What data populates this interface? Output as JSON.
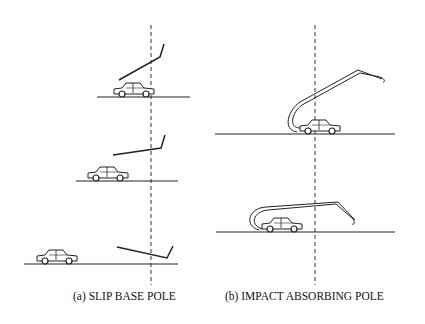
{
  "figure": {
    "captions": {
      "a": "(a)  SLIP BASE POLE",
      "b": "(b)  IMPACT ABSORBING POLE"
    },
    "panels": [
      {
        "id": "a",
        "label": "SLIP BASE POLE",
        "stages": 3,
        "elements": [
          "car",
          "ground-line",
          "pole",
          "dashed-reference-line"
        ]
      },
      {
        "id": "b",
        "label": "IMPACT ABSORBING POLE",
        "stages": 2,
        "elements": [
          "car",
          "ground-line",
          "bent-pole",
          "dashed-reference-line"
        ]
      }
    ],
    "colors": {
      "line": "#222222",
      "background": "#ffffff"
    }
  }
}
